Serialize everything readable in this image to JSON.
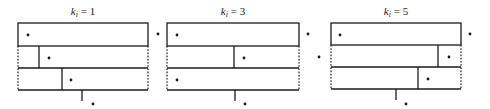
{
  "diagram": {
    "panels": [
      {
        "label_var": "k",
        "label_sub": "i",
        "label_rest": " = 1",
        "k_value": 1,
        "box": {
          "left": 18,
          "right": 148,
          "top": 23,
          "row_bottoms": [
            46,
            68,
            90
          ]
        },
        "row_dividers": [
          null,
          39,
          62
        ],
        "tick_x": 82,
        "dots_inside": [
          [
            28,
            35
          ],
          [
            49,
            58
          ],
          [
            71,
            80
          ]
        ],
        "dots_outside": [
          [
            158,
            34
          ]
        ],
        "dot_bottom": [
          93,
          104
        ]
      },
      {
        "label_var": "k",
        "label_sub": "i",
        "label_rest": " = 3",
        "k_value": 3,
        "box": {
          "left": 167,
          "right": 299,
          "top": 23,
          "row_bottoms": [
            46,
            68,
            90
          ]
        },
        "row_dividers": [
          null,
          234,
          null
        ],
        "tick_x": 235,
        "dots_inside": [
          [
            177,
            35
          ],
          [
            244,
            58
          ],
          [
            177,
            80
          ]
        ],
        "dots_outside": [
          [
            308,
            34
          ],
          [
            319,
            57
          ]
        ],
        "dot_bottom": [
          245,
          104
        ]
      },
      {
        "label_var": "k",
        "label_sub": "i",
        "label_rest": " = 5",
        "k_value": 5,
        "box": {
          "left": 331,
          "right": 461,
          "top": 23,
          "row_bottoms": [
            45,
            67,
            89
          ]
        },
        "row_dividers": [
          null,
          438,
          418
        ],
        "tick_x": 396,
        "dots_inside": [
          [
            340,
            35
          ],
          [
            449,
            57
          ],
          [
            428,
            79
          ]
        ],
        "dots_outside": [
          [
            470,
            34
          ]
        ],
        "dot_bottom": [
          406,
          104
        ]
      }
    ]
  }
}
